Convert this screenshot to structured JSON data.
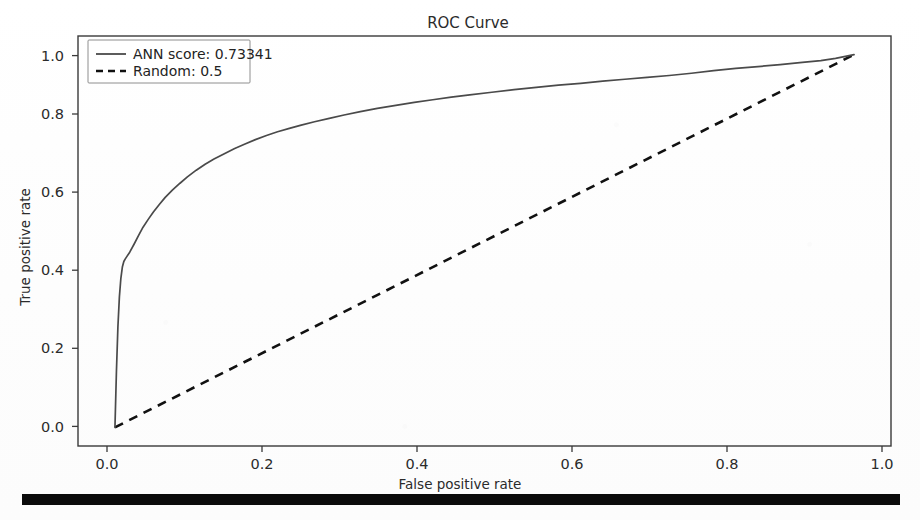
{
  "chart_data": {
    "type": "line",
    "title": "ROC Curve",
    "xlabel": "False positive rate",
    "ylabel": "True positive rate",
    "xlim": [
      -0.05,
      1.05
    ],
    "ylim": [
      -0.05,
      1.05
    ],
    "grid": false,
    "legend_position": "upper left",
    "xticks": [
      "0.0",
      "0.2",
      "0.4",
      "0.6",
      "0.8",
      "1.0"
    ],
    "xtick_values": [
      0.0,
      0.2,
      0.4,
      0.6,
      0.8,
      1.0
    ],
    "yticks": [
      "0.0",
      "0.2",
      "0.4",
      "0.6",
      "0.8",
      "1.0"
    ],
    "ytick_values": [
      0.0,
      0.2,
      0.4,
      0.6,
      0.8,
      1.0
    ],
    "series": [
      {
        "name": "ANN score: 0.73341",
        "style": "solid",
        "color": "#4a4a4a",
        "auc": 0.73341,
        "x": [
          0.0,
          0.002,
          0.004,
          0.006,
          0.008,
          0.01,
          0.012,
          0.014,
          0.016,
          0.02,
          0.026,
          0.032,
          0.038,
          0.045,
          0.052,
          0.06,
          0.068,
          0.078,
          0.088,
          0.098,
          0.11,
          0.122,
          0.134,
          0.148,
          0.162,
          0.176,
          0.19,
          0.205,
          0.22,
          0.236,
          0.252,
          0.27,
          0.29,
          0.31,
          0.332,
          0.355,
          0.38,
          0.405,
          0.43,
          0.455,
          0.48,
          0.51,
          0.54,
          0.57,
          0.6,
          0.63,
          0.66,
          0.69,
          0.72,
          0.75,
          0.78,
          0.81,
          0.84,
          0.87,
          0.9,
          0.93,
          0.955,
          0.975,
          0.99,
          1.0
        ],
        "y": [
          0.0,
          0.15,
          0.27,
          0.35,
          0.4,
          0.43,
          0.445,
          0.452,
          0.458,
          0.47,
          0.492,
          0.515,
          0.537,
          0.558,
          0.578,
          0.598,
          0.617,
          0.637,
          0.655,
          0.672,
          0.69,
          0.706,
          0.72,
          0.734,
          0.748,
          0.76,
          0.772,
          0.783,
          0.793,
          0.802,
          0.811,
          0.82,
          0.829,
          0.838,
          0.847,
          0.856,
          0.864,
          0.872,
          0.879,
          0.886,
          0.892,
          0.899,
          0.906,
          0.912,
          0.918,
          0.923,
          0.929,
          0.934,
          0.939,
          0.944,
          0.95,
          0.957,
          0.963,
          0.968,
          0.973,
          0.979,
          0.984,
          0.99,
          0.996,
          1.0
        ]
      },
      {
        "name": "Random: 0.5",
        "style": "dashed",
        "color": "#111111",
        "auc": 0.5,
        "x": [
          0.0,
          1.0
        ],
        "y": [
          0.0,
          1.0
        ]
      }
    ]
  },
  "legend": {
    "entries": [
      {
        "label": "ANN score: 0.73341",
        "marker": "solid-line"
      },
      {
        "label": "Random: 0.5",
        "marker": "dashed-line"
      }
    ]
  },
  "artifacts": {
    "bottom_rule": "scan-black-bar"
  },
  "colors": {
    "curve": "#4a4a4a",
    "diagonal": "#111111",
    "axis": "#3a3a3a",
    "text": "#2b2b2b",
    "background": "#fefefe"
  }
}
